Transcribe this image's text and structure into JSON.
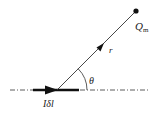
{
  "diagram": {
    "title": "",
    "labels": {
      "charge": "Q",
      "charge_subscript": "m",
      "distance": "r",
      "angle": "θ",
      "current_element": "Iδl"
    },
    "colors": {
      "line": "#222222",
      "background": "#ffffff"
    },
    "elements": {
      "reference_line": "dash-dot horizontal axis",
      "current_element_arrow": "thick arrow pointing right along axis",
      "radius_vector": "line from current element to point charge with arrow",
      "point_charge": "filled dot",
      "angle_arc": "arc between axis and radius vector"
    }
  }
}
